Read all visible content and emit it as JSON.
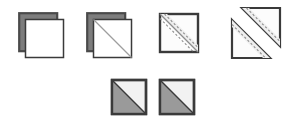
{
  "diagram": {
    "type": "instructional-sequence",
    "background_color": "#ffffff",
    "canvas": {
      "width": 298,
      "height": 116
    },
    "palette": {
      "outline_dark": "#3a3a3a",
      "outline_mid": "#555555",
      "back_square_fill": "#7d7d7d",
      "front_square_fill": "#ffffff",
      "light_panel_fill": "#eeeeee",
      "gray_triangle_fill": "#9a9a9a",
      "white_triangle_fill": "#f2f2f2",
      "dash_line_color": "#8d8d8d"
    },
    "steps": [
      {
        "index": 1,
        "id": "step-stacked-squares",
        "label": "Stack two squares right sides together",
        "shape": "two-offset-squares",
        "size": 38,
        "offset": 6,
        "has_diagonal": false,
        "has_cut_marks": false
      },
      {
        "index": 2,
        "id": "step-draw-diagonal",
        "label": "Draw a diagonal line corner to corner",
        "shape": "two-offset-squares",
        "size": 38,
        "offset": 6,
        "has_diagonal": true,
        "has_cut_marks": false
      },
      {
        "index": 3,
        "id": "step-stitch-and-cut-line",
        "label": "Stitch either side of the line, then cut",
        "shape": "single-square",
        "size": 38,
        "offset": 0,
        "has_diagonal": true,
        "has_cut_marks": true
      },
      {
        "index": 4,
        "id": "step-separated-triangles",
        "label": "Separate into two triangle units",
        "shape": "split-triangles",
        "size": 38,
        "offset": 0,
        "has_diagonal": true,
        "has_cut_marks": true
      },
      {
        "index": 5,
        "id": "step-result-unit-a",
        "label": "Pressed half-square triangle unit",
        "shape": "half-square-triangle",
        "size": 34,
        "offset": 0,
        "has_diagonal": true,
        "has_cut_marks": false
      },
      {
        "index": 6,
        "id": "step-result-unit-b",
        "label": "Pressed half-square triangle unit",
        "shape": "half-square-triangle",
        "size": 34,
        "offset": 0,
        "has_diagonal": true,
        "has_cut_marks": false
      }
    ],
    "rows": [
      {
        "id": "row-top",
        "step_indices": [
          1,
          2,
          3,
          4
        ]
      },
      {
        "id": "row-bottom",
        "step_indices": [
          5,
          6
        ]
      }
    ]
  }
}
